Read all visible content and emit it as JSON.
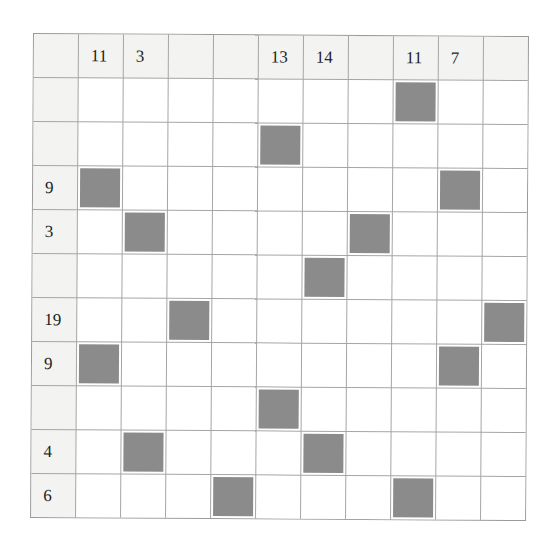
{
  "puzzle": {
    "rows": 10,
    "cols": 10,
    "column_clues": [
      "11",
      "3",
      "",
      "",
      "13",
      "14",
      "",
      "11",
      "7",
      ""
    ],
    "row_clues": [
      "",
      "",
      "9",
      "3",
      "",
      "19",
      "9",
      "",
      "4",
      "6"
    ],
    "shaded_cells": [
      [
        1,
        8
      ],
      [
        2,
        5
      ],
      [
        3,
        1
      ],
      [
        3,
        9
      ],
      [
        4,
        2
      ],
      [
        4,
        7
      ],
      [
        5,
        6
      ],
      [
        6,
        3
      ],
      [
        6,
        10
      ],
      [
        7,
        1
      ],
      [
        7,
        9
      ],
      [
        8,
        5
      ],
      [
        9,
        2
      ],
      [
        9,
        6
      ],
      [
        10,
        4
      ],
      [
        10,
        8
      ]
    ],
    "colors": {
      "shaded": "#8b8b8b",
      "header_bg": "#f3f3f2",
      "cell_bg": "#ffffff",
      "gridline": "#a5a5a5",
      "text": "#1d1d1d"
    }
  }
}
